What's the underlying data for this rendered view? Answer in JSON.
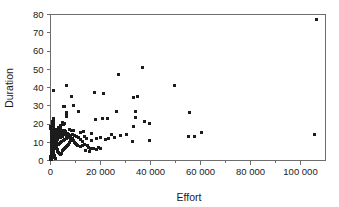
{
  "chart_data": {
    "type": "scatter",
    "title": "",
    "xlabel": "Effort",
    "ylabel": "Duration",
    "xlim": [
      0,
      110000
    ],
    "ylim": [
      0,
      80
    ],
    "xticks": [
      0,
      20000,
      40000,
      60000,
      80000,
      100000
    ],
    "xticklabels": [
      "0",
      "20 000",
      "40 000",
      "60 000",
      "80 000",
      "100 000"
    ],
    "yticks": [
      0,
      10,
      20,
      30,
      40,
      50,
      60,
      70,
      80
    ],
    "yticklabels": [
      "0",
      "10",
      "20",
      "30",
      "40",
      "50",
      "60",
      "70",
      "80"
    ],
    "grid": false,
    "legend": false,
    "marker": "square",
    "marker_color": "#1c1c1c",
    "marker_size_px": 3,
    "frame": true,
    "minor_ticks_x": true,
    "points": [
      [
        1000,
        38.5
      ],
      [
        1200,
        23.0
      ],
      [
        6200,
        41.2
      ],
      [
        5000,
        29.7
      ],
      [
        5600,
        29.7
      ],
      [
        6200,
        26.5
      ],
      [
        6300,
        24.5
      ],
      [
        6500,
        24.2
      ],
      [
        8200,
        35.0
      ],
      [
        9300,
        30.3
      ],
      [
        11000,
        26.8
      ],
      [
        17500,
        37.0
      ],
      [
        21000,
        36.5
      ],
      [
        27000,
        47.2
      ],
      [
        36800,
        51.2
      ],
      [
        33200,
        34.3
      ],
      [
        34600,
        35.0
      ],
      [
        49700,
        41.0
      ],
      [
        55500,
        26.2
      ],
      [
        106500,
        77.0
      ],
      [
        105500,
        14.5
      ],
      [
        60200,
        15.2
      ],
      [
        55100,
        13.3
      ],
      [
        57400,
        13.3
      ],
      [
        39400,
        20.3
      ],
      [
        37700,
        21.5
      ],
      [
        33800,
        23.3
      ],
      [
        34000,
        27.0
      ],
      [
        33000,
        18.6
      ],
      [
        32800,
        10.3
      ],
      [
        39500,
        11.2
      ],
      [
        26200,
        27.0
      ],
      [
        22800,
        23.0
      ],
      [
        17800,
        22.2
      ],
      [
        20600,
        22.8
      ],
      [
        24500,
        14.3
      ],
      [
        21900,
        11.5
      ],
      [
        19000,
        7.0
      ],
      [
        17000,
        6.4
      ],
      [
        15800,
        6.5
      ],
      [
        15100,
        7.3
      ],
      [
        14600,
        8.2
      ],
      [
        13500,
        9.0
      ],
      [
        12600,
        10.2
      ],
      [
        11800,
        11.6
      ],
      [
        11000,
        12.5
      ],
      [
        10200,
        13.0
      ],
      [
        9400,
        13.5
      ],
      [
        12000,
        15.5
      ],
      [
        13000,
        16.0
      ],
      [
        9000,
        16.2
      ],
      [
        8200,
        16.6
      ],
      [
        7400,
        17.0
      ],
      [
        8600,
        14.5
      ],
      [
        7800,
        13.6
      ],
      [
        7000,
        12.8
      ],
      [
        6200,
        12.0
      ],
      [
        5600,
        11.5
      ],
      [
        5000,
        11.0
      ],
      [
        4400,
        10.5
      ],
      [
        4000,
        10.0
      ],
      [
        3600,
        9.5
      ],
      [
        3200,
        9.0
      ],
      [
        2800,
        8.5
      ],
      [
        2400,
        8.0
      ],
      [
        2000,
        7.5
      ],
      [
        1700,
        7.0
      ],
      [
        1400,
        6.5
      ],
      [
        1200,
        6.0
      ],
      [
        1000,
        5.5
      ],
      [
        900,
        5.0
      ],
      [
        800,
        4.5
      ],
      [
        700,
        4.0
      ],
      [
        600,
        3.5
      ],
      [
        500,
        3.0
      ],
      [
        450,
        2.5
      ],
      [
        400,
        2.0
      ],
      [
        350,
        1.5
      ],
      [
        300,
        1.0
      ],
      [
        280,
        0.7
      ],
      [
        260,
        0.4
      ],
      [
        600,
        17.5
      ],
      [
        700,
        18.0
      ],
      [
        800,
        19.0
      ],
      [
        900,
        20.0
      ],
      [
        1000,
        21.0
      ],
      [
        1100,
        19.5
      ],
      [
        1200,
        18.2
      ],
      [
        1400,
        17.2
      ],
      [
        1600,
        16.4
      ],
      [
        1800,
        15.6
      ],
      [
        2000,
        14.8
      ],
      [
        2200,
        14.0
      ],
      [
        2400,
        13.2
      ],
      [
        2600,
        12.4
      ],
      [
        2800,
        11.6
      ],
      [
        3000,
        16.8
      ],
      [
        3200,
        15.8
      ],
      [
        3400,
        14.6
      ],
      [
        3600,
        13.8
      ],
      [
        3800,
        12.6
      ],
      [
        4000,
        17.5
      ],
      [
        4200,
        16.2
      ],
      [
        4400,
        15.0
      ],
      [
        4600,
        14.2
      ],
      [
        4800,
        13.0
      ],
      [
        5200,
        15.2
      ],
      [
        5400,
        16.5
      ],
      [
        5800,
        14.0
      ],
      [
        6000,
        15.8
      ],
      [
        6400,
        13.4
      ],
      [
        6800,
        15.0
      ],
      [
        7200,
        14.2
      ],
      [
        7600,
        12.4
      ],
      [
        8000,
        11.4
      ],
      [
        8400,
        10.8
      ],
      [
        8800,
        12.2
      ],
      [
        9200,
        11.0
      ],
      [
        9600,
        10.0
      ],
      [
        10000,
        9.2
      ],
      [
        10400,
        8.6
      ],
      [
        10800,
        8.0
      ],
      [
        400,
        12.0
      ],
      [
        500,
        13.0
      ],
      [
        600,
        14.0
      ],
      [
        700,
        15.0
      ],
      [
        800,
        15.8
      ],
      [
        900,
        12.8
      ],
      [
        1000,
        11.8
      ],
      [
        1100,
        10.8
      ],
      [
        1200,
        9.8
      ],
      [
        1300,
        8.8
      ],
      [
        1400,
        12.4
      ],
      [
        1500,
        11.4
      ],
      [
        1600,
        10.4
      ],
      [
        1700,
        9.4
      ],
      [
        1800,
        8.4
      ],
      [
        1900,
        13.6
      ],
      [
        2000,
        12.6
      ],
      [
        2100,
        11.6
      ],
      [
        2200,
        10.6
      ],
      [
        2300,
        9.6
      ],
      [
        2400,
        6.8
      ],
      [
        2500,
        7.6
      ],
      [
        2600,
        6.2
      ],
      [
        2700,
        5.6
      ],
      [
        2800,
        5.0
      ],
      [
        300,
        10.5
      ],
      [
        350,
        9.5
      ],
      [
        400,
        8.5
      ],
      [
        450,
        7.5
      ],
      [
        500,
        6.6
      ],
      [
        550,
        5.8
      ],
      [
        600,
        5.2
      ],
      [
        650,
        4.6
      ],
      [
        700,
        9.0
      ],
      [
        750,
        8.2
      ],
      [
        800,
        7.4
      ],
      [
        850,
        6.8
      ],
      [
        900,
        6.2
      ],
      [
        950,
        5.6
      ],
      [
        1000,
        4.8
      ],
      [
        1100,
        4.2
      ],
      [
        1200,
        3.6
      ],
      [
        1300,
        3.0
      ],
      [
        1400,
        2.6
      ],
      [
        1500,
        2.2
      ],
      [
        1600,
        1.8
      ],
      [
        1700,
        1.4
      ],
      [
        1800,
        1.0
      ],
      [
        200,
        16.0
      ],
      [
        250,
        15.0
      ],
      [
        300,
        14.2
      ],
      [
        200,
        13.4
      ],
      [
        250,
        12.4
      ],
      [
        300,
        11.4
      ],
      [
        200,
        10.4
      ],
      [
        250,
        9.4
      ],
      [
        300,
        8.4
      ],
      [
        200,
        7.4
      ],
      [
        250,
        6.4
      ],
      [
        300,
        5.4
      ],
      [
        200,
        4.4
      ],
      [
        250,
        3.4
      ],
      [
        300,
        2.4
      ],
      [
        200,
        1.4
      ],
      [
        150,
        18.5
      ],
      [
        150,
        17.5
      ],
      [
        150,
        2.0
      ],
      [
        150,
        0.8
      ],
      [
        3000,
        4.4
      ],
      [
        3400,
        3.8
      ],
      [
        3800,
        3.2
      ],
      [
        4200,
        4.0
      ],
      [
        4600,
        5.4
      ],
      [
        5000,
        6.0
      ],
      [
        5400,
        6.6
      ],
      [
        5800,
        7.2
      ],
      [
        6200,
        7.8
      ],
      [
        6600,
        8.4
      ],
      [
        7000,
        9.0
      ],
      [
        7400,
        9.6
      ],
      [
        12000,
        7.6
      ],
      [
        12800,
        8.4
      ],
      [
        13600,
        13.0
      ],
      [
        14400,
        12.0
      ],
      [
        16200,
        11.0
      ],
      [
        18500,
        12.0
      ],
      [
        20000,
        12.6
      ],
      [
        23000,
        12.2
      ],
      [
        25500,
        12.8
      ],
      [
        28000,
        13.6
      ],
      [
        30500,
        14.4
      ],
      [
        16500,
        15.0
      ],
      [
        14000,
        5.5
      ],
      [
        15500,
        5.0
      ],
      [
        18200,
        5.8
      ],
      [
        19800,
        6.8
      ],
      [
        5200,
        19.5
      ],
      [
        5600,
        20.5
      ],
      [
        4600,
        20.8
      ],
      [
        3800,
        19.0
      ],
      [
        3000,
        18.0
      ],
      [
        2600,
        17.0
      ],
      [
        2200,
        16.2
      ],
      [
        1900,
        15.2
      ],
      [
        1600,
        14.4
      ],
      [
        1300,
        13.4
      ],
      [
        1100,
        14.6
      ],
      [
        900,
        16.8
      ],
      [
        700,
        11.2
      ],
      [
        500,
        10.0
      ],
      [
        400,
        18.8
      ],
      [
        600,
        20.2
      ],
      [
        800,
        21.5
      ],
      [
        1000,
        22.2
      ],
      [
        450,
        1.2
      ],
      [
        550,
        0.6
      ]
    ]
  }
}
